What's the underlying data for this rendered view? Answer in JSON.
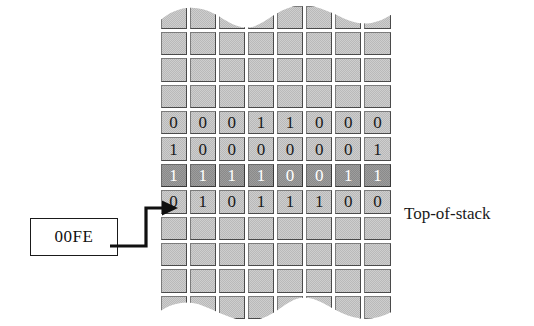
{
  "figure": {
    "pointer_label": "00FE",
    "stack_caption": "Top-of-stack",
    "columns": 8,
    "colors": {
      "cell_fill": "#b9b9b9",
      "cell_border_light": "#7c7c7c",
      "cell_border_dark": "#4a4a4a",
      "highlight_fill": "#8a8a8a",
      "highlight_text": "#ffffff",
      "ink": "#1a1a1a",
      "background": "#ffffff"
    }
  },
  "memory": {
    "rows": [
      {
        "id": "row-pad-top-0",
        "cells": [
          "",
          "",
          "",
          "",
          "",
          "",
          "",
          ""
        ],
        "highlight": false,
        "empty": true
      },
      {
        "id": "row-pad-top-1",
        "cells": [
          "",
          "",
          "",
          "",
          "",
          "",
          "",
          ""
        ],
        "highlight": false,
        "empty": true
      },
      {
        "id": "row-pad-top-2",
        "cells": [
          "",
          "",
          "",
          "",
          "",
          "",
          "",
          ""
        ],
        "highlight": false,
        "empty": true
      },
      {
        "id": "row-pad-top-3",
        "cells": [
          "",
          "",
          "",
          "",
          "",
          "",
          "",
          ""
        ],
        "highlight": false,
        "empty": true
      },
      {
        "id": "row-data-0",
        "cells": [
          "0",
          "0",
          "0",
          "1",
          "1",
          "0",
          "0",
          "0"
        ],
        "highlight": false,
        "empty": false
      },
      {
        "id": "row-data-1",
        "cells": [
          "1",
          "0",
          "0",
          "0",
          "0",
          "0",
          "0",
          "1"
        ],
        "highlight": false,
        "empty": false
      },
      {
        "id": "row-top-of-stack",
        "cells": [
          "1",
          "1",
          "1",
          "1",
          "0",
          "0",
          "1",
          "1"
        ],
        "highlight": true,
        "empty": false
      },
      {
        "id": "row-data-3",
        "cells": [
          "0",
          "1",
          "0",
          "1",
          "1",
          "1",
          "0",
          "0"
        ],
        "highlight": false,
        "empty": false
      },
      {
        "id": "row-pad-bottom-0",
        "cells": [
          "",
          "",
          "",
          "",
          "",
          "",
          "",
          ""
        ],
        "highlight": false,
        "empty": true
      },
      {
        "id": "row-pad-bottom-1",
        "cells": [
          "",
          "",
          "",
          "",
          "",
          "",
          "",
          ""
        ],
        "highlight": false,
        "empty": true
      },
      {
        "id": "row-pad-bottom-2",
        "cells": [
          "",
          "",
          "",
          "",
          "",
          "",
          "",
          ""
        ],
        "highlight": false,
        "empty": true
      },
      {
        "id": "row-pad-bottom-3",
        "cells": [
          "",
          "",
          "",
          "",
          "",
          "",
          "",
          ""
        ],
        "highlight": false,
        "empty": true
      }
    ],
    "bit_strings": {
      "row_data_0": "00011000",
      "row_data_1": "10000001",
      "row_top_of_stack": "11110011",
      "row_data_3": "01011100"
    }
  },
  "icons": {
    "arrow": "arrow-right-icon",
    "wave_edge": "torn-wave-edge"
  }
}
